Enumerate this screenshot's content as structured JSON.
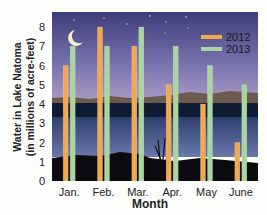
{
  "chart_data": {
    "type": "bar",
    "title": "",
    "xlabel": "Month",
    "ylabel_line1": "Water in Lake Natoma",
    "ylabel_line2": "(in millions of acre-feet)",
    "categories": [
      "Jan.",
      "Feb.",
      "Mar.",
      "Apr.",
      "May",
      "June"
    ],
    "series": [
      {
        "name": "2012",
        "color": "#f2a94e",
        "values": [
          6,
          8,
          7,
          5,
          4,
          2
        ]
      },
      {
        "name": "2013",
        "color": "#a8d5a0",
        "values": [
          7,
          7,
          8,
          7,
          6,
          5
        ]
      }
    ],
    "ylim": [
      0,
      8
    ],
    "yticks": [
      "0",
      "1",
      "2",
      "3",
      "4",
      "5",
      "6",
      "7",
      "8"
    ],
    "grid": false,
    "legend": "top-right",
    "background": "night lake scene with moon"
  }
}
